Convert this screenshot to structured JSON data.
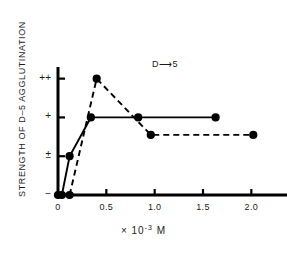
{
  "chart_data": {
    "type": "line",
    "title": "",
    "annotation": "D⟶5",
    "xlabel": "× 10⁻³ M",
    "ylabel": "STRENGTH OF D–5 AGGLUTINATION",
    "xlabel_prefix": "× 10",
    "xlabel_exponent": "-3",
    "xlabel_suffix": "M",
    "xlim": [
      0,
      2.4
    ],
    "ylim": [
      0,
      3.3
    ],
    "grid": false,
    "legend": "none",
    "x_ticks": [
      0,
      0.5,
      1.0,
      1.5,
      2.0
    ],
    "x_tick_labels": [
      "0",
      "0.5",
      "1.0",
      "1.5",
      "2.0"
    ],
    "y_ticks": [
      0,
      1,
      2,
      3
    ],
    "y_tick_labels": [
      "−",
      "±",
      "+",
      "++"
    ],
    "series": [
      {
        "name": "solid",
        "style": "solid",
        "marker": "filled-circle",
        "x": [
          0.0,
          0.04,
          0.12,
          0.34,
          0.83,
          1.63
        ],
        "y": [
          0,
          0,
          1,
          2,
          2,
          2
        ]
      },
      {
        "name": "dashed",
        "style": "dashed",
        "marker": "filled-circle",
        "x": [
          0.12,
          0.4,
          0.96,
          2.02
        ],
        "y": [
          0,
          3,
          1.55,
          1.55
        ]
      }
    ]
  }
}
